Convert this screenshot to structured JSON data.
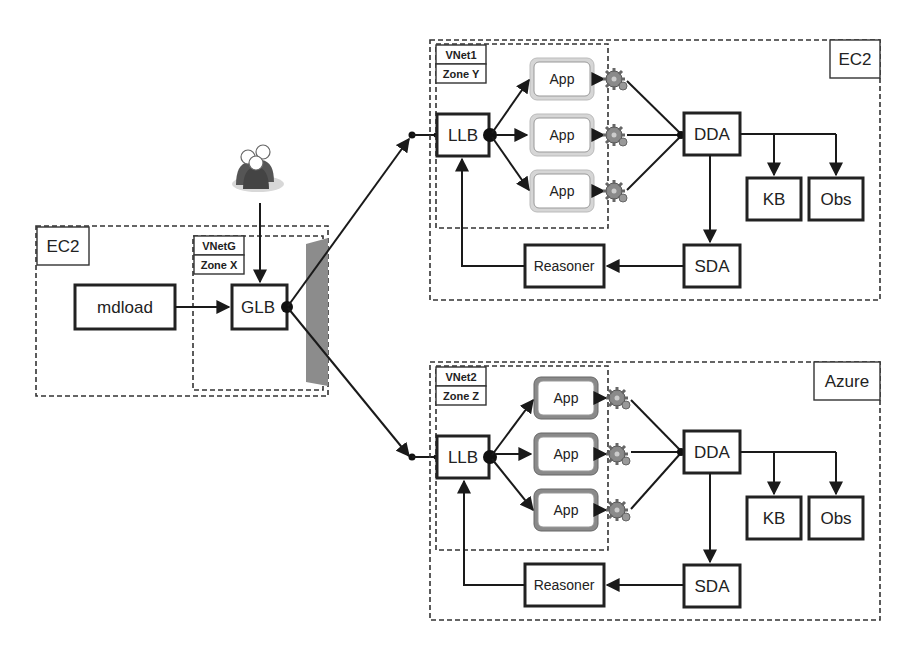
{
  "diagram": {
    "users": {
      "icon": "users-group-icon"
    },
    "ec2_left": {
      "title": "EC2",
      "vnet_label": "VNetG",
      "zone_label": "Zone X",
      "mdload": "mdload",
      "glb": "GLB",
      "firewall": {
        "icon": "firewall-panel-icon"
      }
    },
    "ec2_top": {
      "title": "EC2",
      "vnet_label": "VNet1",
      "zone_label": "Zone Y",
      "llb": "LLB",
      "apps": [
        "App",
        "App",
        "App"
      ],
      "dda": "DDA",
      "kb": "KB",
      "obs": "Obs",
      "sda": "SDA",
      "reasoner": "Reasoner",
      "gear_icon": "gear-icon"
    },
    "azure": {
      "title": "Azure",
      "vnet_label": "VNet2",
      "zone_label": "Zone Z",
      "llb": "LLB",
      "apps": [
        "App",
        "App",
        "App"
      ],
      "dda": "DDA",
      "kb": "KB",
      "obs": "Obs",
      "sda": "SDA",
      "reasoner": "Reasoner",
      "gear_icon": "gear-icon"
    },
    "colors": {
      "stroke": "#1a1a1a",
      "app_ring_light": "#d6d6d6",
      "app_ring_dark": "#8a8a8a",
      "firewall": "#8c8c8c",
      "users": "#555555"
    }
  }
}
